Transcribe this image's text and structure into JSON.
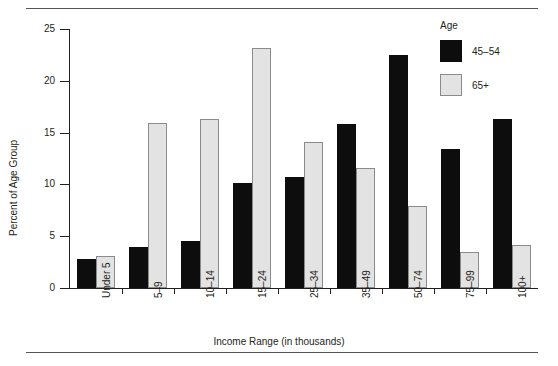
{
  "chart_data": {
    "type": "bar",
    "title": "",
    "xlabel": "Income Range (in thousands)",
    "ylabel": "Percent of Age Group",
    "ylim": [
      0,
      25
    ],
    "yticks": [
      0,
      5,
      10,
      15,
      20,
      25
    ],
    "ytick_labels": [
      "0",
      "5",
      "10",
      "15",
      "20",
      "25"
    ],
    "grid": false,
    "legend_title": "Age",
    "legend_position": "top-right",
    "categories": [
      "Under 5",
      "5–9",
      "10–14",
      "15–24",
      "25–34",
      "35–49",
      "50–74",
      "75–99",
      "100+"
    ],
    "series": [
      {
        "name": "45–54",
        "color": "#0d0d0d",
        "values": [
          2.8,
          4.0,
          4.5,
          10.1,
          10.7,
          15.8,
          22.5,
          13.4,
          16.3
        ]
      },
      {
        "name": "65+",
        "color": "#e3e3e3",
        "values": [
          3.1,
          15.9,
          16.3,
          23.2,
          14.1,
          11.6,
          7.9,
          3.5,
          4.2
        ]
      }
    ]
  }
}
